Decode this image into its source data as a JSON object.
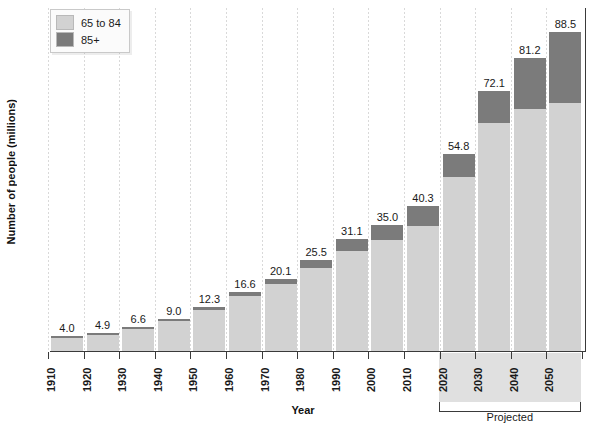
{
  "chart_data": {
    "type": "bar",
    "subtype": "stacked-bar",
    "title": "",
    "xlabel": "Year",
    "ylabel": "Number of people (millions)",
    "ylim": [
      0,
      95
    ],
    "grid": "vertical-dotted",
    "legend_position": "top-left",
    "categories": [
      "1910",
      "1920",
      "1930",
      "1940",
      "1950",
      "1960",
      "1970",
      "1980",
      "1990",
      "2000",
      "2010",
      "2020",
      "2030",
      "2040",
      "2050"
    ],
    "totals": [
      4.0,
      4.9,
      6.6,
      9.0,
      12.3,
      16.6,
      20.1,
      25.5,
      31.1,
      35.0,
      40.3,
      54.8,
      72.1,
      81.2,
      88.5
    ],
    "total_labels": [
      "4.0",
      "4.9",
      "6.6",
      "9.0",
      "12.3",
      "16.6",
      "20.1",
      "25.5",
      "31.1",
      "35.0",
      "40.3",
      "54.8",
      "72.1",
      "81.2",
      "88.5"
    ],
    "series": [
      {
        "name": "65 to 84",
        "color": "#d2d2d2",
        "values": [
          3.9,
          4.8,
          6.4,
          8.6,
          11.7,
          15.6,
          18.7,
          23.3,
          28.0,
          30.8,
          34.8,
          48.4,
          63.3,
          67.2,
          68.7
        ]
      },
      {
        "name": "85+",
        "color": "#7b7b7b",
        "values": [
          0.1,
          0.1,
          0.2,
          0.4,
          0.6,
          1.0,
          1.4,
          2.2,
          3.1,
          4.2,
          5.5,
          6.4,
          8.8,
          14.0,
          19.8
        ]
      }
    ],
    "annotations": [
      {
        "name": "projected",
        "label": "Projected",
        "from_category": "2020",
        "to_category": "2050"
      }
    ]
  },
  "legend": {
    "items": [
      {
        "label": "65 to 84",
        "color": "#d2d2d2"
      },
      {
        "label": "85+",
        "color": "#7b7b7b"
      }
    ]
  },
  "axes": {
    "x_title": "Year",
    "y_title": "Number of people (millions)"
  },
  "projected": {
    "label": "Projected"
  }
}
